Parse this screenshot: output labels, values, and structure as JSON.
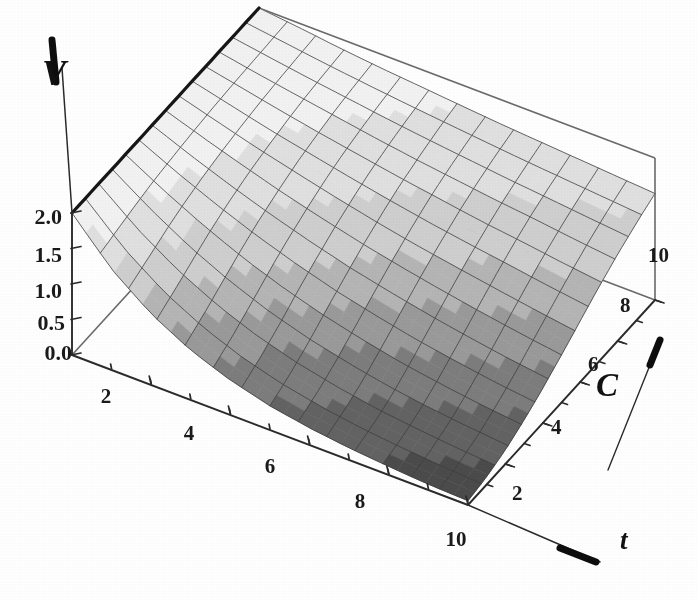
{
  "figure": {
    "kind": "3d-surface-plot",
    "style": "grayscale-scanned-mathematica-plot3d",
    "background_color": "#ffffff",
    "line_color": "#262626",
    "box_line_color": "#555555"
  },
  "axes": {
    "vertical": {
      "name": "V",
      "label": "V",
      "tick_labels": [
        "2.0",
        "1.5",
        "1.0",
        "0.5",
        "0.0"
      ],
      "tick_values": [
        2.0,
        1.5,
        1.0,
        0.5,
        0.0
      ],
      "range": [
        0.0,
        2.0
      ],
      "arrow": "up"
    },
    "depth": {
      "name": "C",
      "label": "C",
      "tick_labels": [
        "2",
        "4",
        "6",
        "8",
        "10"
      ],
      "tick_values": [
        2,
        4,
        6,
        8,
        10
      ],
      "range": [
        0,
        10
      ],
      "arrow": "up-right"
    },
    "horizontal": {
      "name": "t",
      "label": "t",
      "tick_labels": [
        "2",
        "4",
        "6",
        "8",
        "10"
      ],
      "tick_values": [
        2,
        4,
        6,
        8,
        10
      ],
      "range": [
        0,
        10
      ],
      "arrow": "down-right"
    }
  },
  "chart_data": {
    "type": "surface",
    "title": "",
    "xlabel": "t",
    "ylabel": "C",
    "zlabel": "V",
    "xlim": [
      0,
      10
    ],
    "ylim": [
      0,
      10
    ],
    "zlim": [
      0,
      2
    ],
    "x_ticks": [
      2,
      4,
      6,
      8,
      10
    ],
    "y_ticks": [
      2,
      4,
      6,
      8,
      10
    ],
    "z_ticks": [
      0.0,
      0.5,
      1.0,
      1.5,
      2.0
    ],
    "grid": true,
    "legend": "none",
    "colormap": "grayscale",
    "colormap_note": "light gray at high V, dark gray at low V",
    "mesh_lines": 14,
    "x": [
      0,
      1,
      2,
      3,
      4,
      5,
      6,
      7,
      8,
      9,
      10
    ],
    "y": [
      0,
      1,
      2,
      3,
      4,
      5,
      6,
      7,
      8,
      9,
      10
    ],
    "z_grid": [
      [
        2.0,
        2.0,
        2.0,
        2.0,
        2.0,
        2.0,
        2.0,
        2.0,
        2.0,
        2.0,
        2.0
      ],
      [
        1.42,
        1.52,
        1.62,
        1.7,
        1.76,
        1.81,
        1.85,
        1.88,
        1.9,
        1.92,
        1.94
      ],
      [
        1.0,
        1.14,
        1.29,
        1.43,
        1.54,
        1.63,
        1.7,
        1.76,
        1.81,
        1.84,
        1.87
      ],
      [
        0.7,
        0.85,
        1.02,
        1.19,
        1.34,
        1.46,
        1.57,
        1.65,
        1.72,
        1.77,
        1.81
      ],
      [
        0.49,
        0.63,
        0.8,
        0.99,
        1.16,
        1.31,
        1.44,
        1.55,
        1.63,
        1.7,
        1.76
      ],
      [
        0.34,
        0.47,
        0.63,
        0.82,
        1.0,
        1.17,
        1.32,
        1.45,
        1.55,
        1.64,
        1.71
      ],
      [
        0.24,
        0.35,
        0.5,
        0.68,
        0.87,
        1.05,
        1.21,
        1.36,
        1.48,
        1.58,
        1.66
      ],
      [
        0.17,
        0.26,
        0.39,
        0.56,
        0.75,
        0.94,
        1.12,
        1.27,
        1.41,
        1.52,
        1.62
      ],
      [
        0.12,
        0.2,
        0.31,
        0.47,
        0.65,
        0.84,
        1.03,
        1.2,
        1.35,
        1.47,
        1.58
      ],
      [
        0.08,
        0.15,
        0.25,
        0.39,
        0.56,
        0.75,
        0.94,
        1.12,
        1.28,
        1.42,
        1.54
      ],
      [
        0.06,
        0.11,
        0.2,
        0.33,
        0.49,
        0.67,
        0.86,
        1.05,
        1.22,
        1.37,
        1.5
      ]
    ],
    "z_grid_note": "rows indexed by t = 0..10, columns indexed by C = 0..10; V decreases with t and increases with C",
    "surface_description": "Monotonically decreasing in t, increasing in C; equals 2.0 along the back edge t=0 and falls to near 0 at the front corner t=10, C=0",
    "shading_bands": [
      {
        "v_range": [
          1.7,
          2.0
        ],
        "hex": "#f2f2f2"
      },
      {
        "v_range": [
          1.4,
          1.7
        ],
        "hex": "#e0e0e0"
      },
      {
        "v_range": [
          1.1,
          1.4
        ],
        "hex": "#cfcfcf"
      },
      {
        "v_range": [
          0.85,
          1.1
        ],
        "hex": "#b5b5b5"
      },
      {
        "v_range": [
          0.6,
          0.85
        ],
        "hex": "#9a9a9a"
      },
      {
        "v_range": [
          0.35,
          0.6
        ],
        "hex": "#7d7d7d"
      },
      {
        "v_range": [
          0.15,
          0.35
        ],
        "hex": "#636363"
      },
      {
        "v_range": [
          0.0,
          0.15
        ],
        "hex": "#4c4c4c"
      }
    ]
  }
}
